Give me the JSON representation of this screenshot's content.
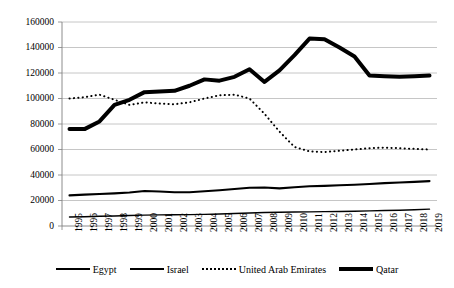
{
  "chart_data": {
    "type": "line",
    "title": "",
    "xlabel": "",
    "ylabel": "",
    "grid": true,
    "legend_position": "bottom",
    "ylim": [
      0,
      160000
    ],
    "ytick_values": [
      0,
      20000,
      40000,
      60000,
      80000,
      100000,
      120000,
      140000,
      160000
    ],
    "ytick_labels": [
      "0",
      "20000",
      "40000",
      "60000",
      "80000",
      "100000",
      "120000",
      "140000",
      "160000"
    ],
    "categories": [
      "1995",
      "1996",
      "1997",
      "1998",
      "1999",
      "2000",
      "2001",
      "2002",
      "2003",
      "2004",
      "2005",
      "2006",
      "2007",
      "2008",
      "2009",
      "2010",
      "2011",
      "2012",
      "2013",
      "2014",
      "2015",
      "2016",
      "2017",
      "2018",
      "2019"
    ],
    "series": [
      {
        "name": "Egypt",
        "style": "solid-thin",
        "color": "#000000",
        "values": [
          7000,
          7300,
          7600,
          7900,
          8200,
          8500,
          8700,
          8800,
          8900,
          9100,
          9400,
          9800,
          10200,
          10600,
          10800,
          11000,
          11100,
          11300,
          11400,
          11600,
          11900,
          12200,
          12400,
          12800,
          13200
        ]
      },
      {
        "name": "Israel",
        "style": "solid-medium",
        "color": "#000000",
        "values": [
          24000,
          24600,
          25100,
          25600,
          26300,
          27500,
          27000,
          26500,
          26500,
          27200,
          28000,
          29000,
          30000,
          30200,
          29500,
          30400,
          31200,
          31500,
          32000,
          32400,
          33000,
          33600,
          34100,
          34600,
          35200
        ]
      },
      {
        "name": "United Arab Emirates",
        "style": "dotted",
        "color": "#000000",
        "values": [
          100000,
          101000,
          103000,
          99000,
          95000,
          97000,
          96000,
          95500,
          97000,
          100000,
          102500,
          103000,
          100000,
          88000,
          74000,
          62000,
          58500,
          58000,
          59000,
          60000,
          61000,
          61500,
          61000,
          60500,
          60000
        ]
      },
      {
        "name": "Qatar",
        "style": "solid-thick",
        "color": "#000000",
        "values": [
          76000,
          76000,
          82000,
          95000,
          99000,
          105000,
          105500,
          106000,
          110000,
          115000,
          114000,
          117000,
          123000,
          113000,
          122000,
          134000,
          147000,
          146500,
          140000,
          133000,
          118000,
          117500,
          117000,
          117500,
          118000
        ]
      }
    ]
  },
  "legend": {
    "entries": [
      {
        "label": "Egypt",
        "style": "solid-thin"
      },
      {
        "label": "Israel",
        "style": "solid-medium"
      },
      {
        "label": "United Arab Emirates",
        "style": "dotted"
      },
      {
        "label": "Qatar",
        "style": "solid-thick"
      }
    ]
  },
  "axes": {
    "plot_left": 62,
    "plot_right": 437,
    "plot_top": 22,
    "plot_bottom": 226
  }
}
